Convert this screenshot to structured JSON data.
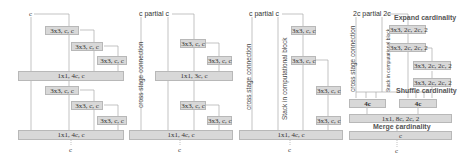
{
  "panels": [
    {
      "input": "c",
      "blocks1": [
        "3x3, c, c",
        "3x3, c, c",
        "3x3, c, c"
      ],
      "merge1": "1x1, 4c, c",
      "blocks2": [
        "3x3, c, c",
        "3x3, c, c",
        "3x3, c, c"
      ],
      "merge2": "1x1, 4c, c",
      "output": "c"
    },
    {
      "input": "c partial c",
      "side_label": "cross stage connection",
      "blocks1": [
        "3x3, c, c",
        "3x3, c, c"
      ],
      "merge1": "1x1, 3c, c",
      "blocks2": [
        "3x3, c, c",
        "3x3, c, c"
      ],
      "merge2": "1x1, 4c, c",
      "output": "c"
    },
    {
      "input": "c partial c",
      "side_label": "cross stage connection",
      "stack_label": "Stack in computational block",
      "blocks": [
        "3x3, c, c",
        "3x3, c, c",
        "3x3, c, c",
        "3x3, c, c"
      ],
      "merge": "1x1, 4c, c",
      "output": "c"
    },
    {
      "input": "2c partial 2c",
      "side_label": "cross stage connection",
      "stack_label": "Stack in computational block",
      "expand_label": "Expand cardinality",
      "blocks": [
        "3x3, 2c, 2c, 2",
        "3x3, 2c, 2c, 2",
        "3x3, 2c, 2c, 2",
        "3x3, 2c, 2c, 2"
      ],
      "shuffle_label": "Shuffle cardinality",
      "shuffle_boxes": [
        "4c",
        "4c"
      ],
      "merge": "1x1, 8c, 2c, 2",
      "merge_label": "Merge cardinality",
      "final": "c",
      "output": "c"
    }
  ]
}
